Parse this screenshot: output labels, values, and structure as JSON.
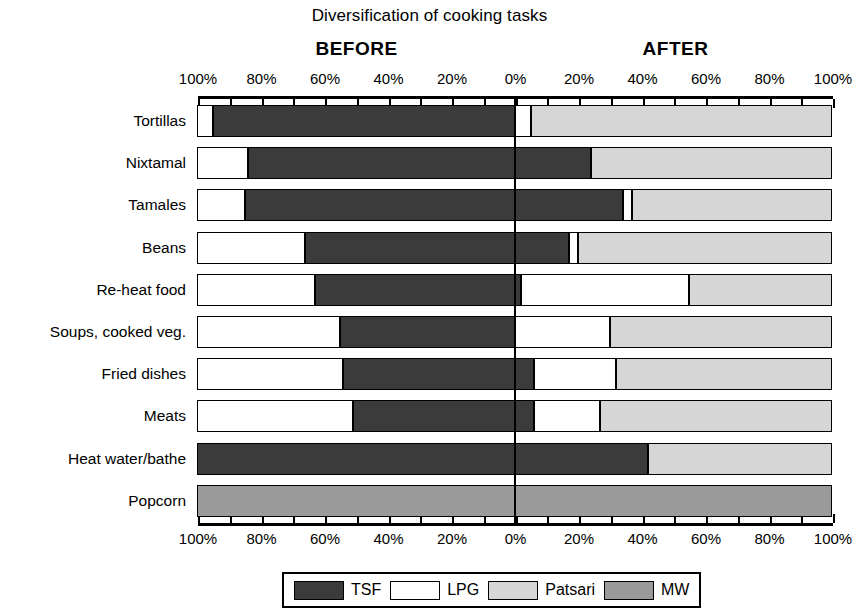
{
  "chart_data": {
    "type": "bar",
    "subtype": "diverging-stacked-100-percent",
    "title": "Diversification of cooking tasks",
    "xlabel": "",
    "ylabel": "",
    "panel_labels": {
      "left": "BEFORE",
      "right": "AFTER"
    },
    "xlim_left": [
      100,
      0
    ],
    "xlim_right": [
      0,
      100
    ],
    "tick_values_left": [
      "100%",
      "80%",
      "60%",
      "40%",
      "20%"
    ],
    "tick_values_right": [
      "0%",
      "20%",
      "40%",
      "60%",
      "80%",
      "100%"
    ],
    "tick_labels": [
      "100%",
      "80%",
      "60%",
      "40%",
      "20%",
      "0%",
      "20%",
      "40%",
      "60%",
      "80%",
      "100%"
    ],
    "minor_ticks_per_interval": 2,
    "grid": false,
    "legend_position": "bottom",
    "legend": [
      "TSF",
      "LPG",
      "Patsari",
      "MW"
    ],
    "colors": {
      "TSF": "#3b3b3b",
      "LPG": "#ffffff",
      "Patsari": "#d6d6d6",
      "MW": "#9a9a9a"
    },
    "categories": [
      "Tortillas",
      "Nixtamal",
      "Tamales",
      "Beans",
      "Re-heat food",
      "Soups, cooked veg.",
      "Fried dishes",
      "Meats",
      "Heat water/bathe",
      "Popcorn"
    ],
    "series_before": [
      {
        "name": "TSF",
        "values": [
          95,
          84,
          85,
          66,
          63,
          55,
          54,
          51,
          100,
          0
        ]
      },
      {
        "name": "LPG",
        "values": [
          5,
          16,
          15,
          34,
          37,
          45,
          46,
          49,
          0,
          0
        ]
      },
      {
        "name": "Patsari",
        "values": [
          0,
          0,
          0,
          0,
          0,
          0,
          0,
          0,
          0,
          0
        ]
      },
      {
        "name": "MW",
        "values": [
          0,
          0,
          0,
          0,
          0,
          0,
          0,
          0,
          0,
          100
        ]
      }
    ],
    "series_after": [
      {
        "name": "TSF",
        "values": [
          0,
          24,
          34,
          17,
          2,
          0,
          6,
          6,
          42,
          0
        ]
      },
      {
        "name": "LPG",
        "values": [
          5,
          0,
          3,
          3,
          53,
          30,
          26,
          21,
          0,
          0
        ]
      },
      {
        "name": "Patsari",
        "values": [
          95,
          76,
          63,
          80,
          45,
          70,
          68,
          73,
          58,
          0
        ]
      },
      {
        "name": "MW",
        "values": [
          0,
          0,
          0,
          0,
          0,
          0,
          0,
          0,
          0,
          100
        ]
      }
    ],
    "rows": [
      {
        "category": "Tortillas",
        "before": [
          {
            "k": "LPG",
            "v": 5
          },
          {
            "k": "TSF",
            "v": 95
          }
        ],
        "after": [
          {
            "k": "LPG",
            "v": 5
          },
          {
            "k": "Patsari",
            "v": 95
          }
        ]
      },
      {
        "category": "Nixtamal",
        "before": [
          {
            "k": "LPG",
            "v": 16
          },
          {
            "k": "TSF",
            "v": 84
          }
        ],
        "after": [
          {
            "k": "TSF",
            "v": 24
          },
          {
            "k": "Patsari",
            "v": 76
          }
        ]
      },
      {
        "category": "Tamales",
        "before": [
          {
            "k": "LPG",
            "v": 15
          },
          {
            "k": "TSF",
            "v": 85
          }
        ],
        "after": [
          {
            "k": "TSF",
            "v": 34
          },
          {
            "k": "LPG",
            "v": 3
          },
          {
            "k": "Patsari",
            "v": 63
          }
        ]
      },
      {
        "category": "Beans",
        "before": [
          {
            "k": "LPG",
            "v": 34
          },
          {
            "k": "TSF",
            "v": 66
          }
        ],
        "after": [
          {
            "k": "TSF",
            "v": 17
          },
          {
            "k": "LPG",
            "v": 3
          },
          {
            "k": "Patsari",
            "v": 80
          }
        ]
      },
      {
        "category": "Re-heat food",
        "before": [
          {
            "k": "LPG",
            "v": 37
          },
          {
            "k": "TSF",
            "v": 63
          }
        ],
        "after": [
          {
            "k": "TSF",
            "v": 2
          },
          {
            "k": "LPG",
            "v": 53
          },
          {
            "k": "Patsari",
            "v": 45
          }
        ]
      },
      {
        "category": "Soups, cooked veg.",
        "before": [
          {
            "k": "LPG",
            "v": 45
          },
          {
            "k": "TSF",
            "v": 55
          }
        ],
        "after": [
          {
            "k": "TSF",
            "v": 0
          },
          {
            "k": "LPG",
            "v": 30
          },
          {
            "k": "Patsari",
            "v": 70
          }
        ]
      },
      {
        "category": "Fried dishes",
        "before": [
          {
            "k": "LPG",
            "v": 46
          },
          {
            "k": "TSF",
            "v": 54
          }
        ],
        "after": [
          {
            "k": "TSF",
            "v": 6
          },
          {
            "k": "LPG",
            "v": 26
          },
          {
            "k": "Patsari",
            "v": 68
          }
        ]
      },
      {
        "category": "Meats",
        "before": [
          {
            "k": "LPG",
            "v": 49
          },
          {
            "k": "TSF",
            "v": 51
          }
        ],
        "after": [
          {
            "k": "TSF",
            "v": 6
          },
          {
            "k": "LPG",
            "v": 21
          },
          {
            "k": "Patsari",
            "v": 73
          }
        ]
      },
      {
        "category": "Heat water/bathe",
        "before": [
          {
            "k": "TSF",
            "v": 100
          }
        ],
        "after": [
          {
            "k": "TSF",
            "v": 42
          },
          {
            "k": "Patsari",
            "v": 58
          }
        ]
      },
      {
        "category": "Popcorn",
        "before": [
          {
            "k": "MW",
            "v": 100
          }
        ],
        "after": [
          {
            "k": "MW",
            "v": 100
          }
        ]
      }
    ]
  }
}
